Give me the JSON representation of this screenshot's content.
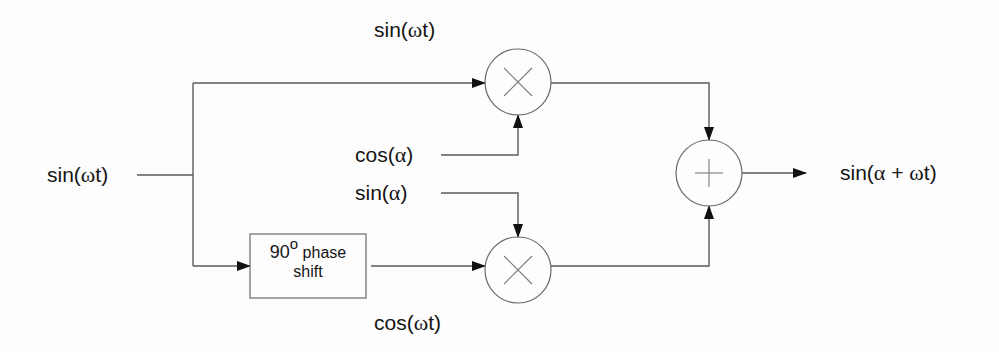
{
  "diagram": {
    "type": "block-diagram",
    "input": {
      "label_prefix": "sin(",
      "label_greek": "ω",
      "label_suffix": "t)"
    },
    "top_path_label": {
      "prefix": "sin(",
      "greek": "ω",
      "suffix": "t)"
    },
    "bottom_path_label": {
      "prefix": "cos(",
      "greek": "ω",
      "suffix": "t)"
    },
    "cos_alpha": {
      "prefix": "cos(",
      "greek": "α",
      "suffix": ")"
    },
    "sin_alpha": {
      "prefix": "sin(",
      "greek": "α",
      "suffix": ")"
    },
    "phase_shift_box": {
      "line1_value": "90",
      "line1_sup": "o",
      "line1_text": "phase",
      "line2": "shift"
    },
    "multiplier_symbol": "×",
    "adder_symbol": "+",
    "output": {
      "prefix": "sin(",
      "greek1": "α",
      "middle": " + ",
      "greek2": "ω",
      "suffix": "t)"
    },
    "blocks": [
      {
        "id": "multiplier-top",
        "kind": "multiplier",
        "cx": 518,
        "cy": 82,
        "r": 33
      },
      {
        "id": "multiplier-bottom",
        "kind": "multiplier",
        "cx": 518,
        "cy": 270,
        "r": 33
      },
      {
        "id": "adder",
        "kind": "adder",
        "cx": 709,
        "cy": 173,
        "r": 33
      },
      {
        "id": "phase-shift",
        "kind": "box",
        "x": 250,
        "y": 234,
        "w": 116,
        "h": 64
      }
    ]
  },
  "colors": {
    "line": "#5a5a5a",
    "text": "#151515",
    "background": "#fdfdfd"
  }
}
